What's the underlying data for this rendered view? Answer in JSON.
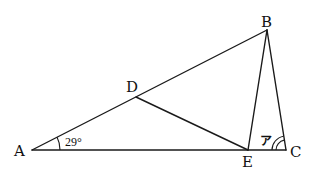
{
  "figure": {
    "type": "geometry",
    "points": {
      "A": {
        "label": "A",
        "x": 32,
        "y": 150
      },
      "B": {
        "label": "B",
        "x": 267,
        "y": 30
      },
      "C": {
        "label": "C",
        "x": 286,
        "y": 150
      },
      "D": {
        "label": "D",
        "x": 136,
        "y": 97
      },
      "E": {
        "label": "E",
        "x": 248,
        "y": 150
      }
    },
    "segments": [
      {
        "from": "A",
        "to": "B"
      },
      {
        "from": "A",
        "to": "C"
      },
      {
        "from": "B",
        "to": "C"
      },
      {
        "from": "B",
        "to": "E"
      },
      {
        "from": "D",
        "to": "E"
      }
    ],
    "angle_marks": {
      "angle_A": {
        "vertex": "A",
        "label": "29°",
        "arcs": 1
      },
      "angle_C": {
        "vertex": "C",
        "label": "ア",
        "arcs": 2
      }
    }
  },
  "colors": {
    "line": "#1a1a1a",
    "background": "#ffffff"
  }
}
